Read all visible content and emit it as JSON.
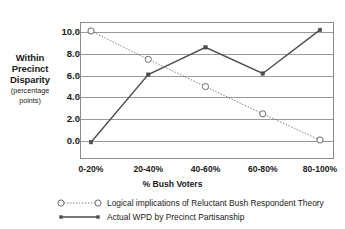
{
  "chart_data": {
    "type": "line",
    "title": "",
    "xlabel": "% Bush Voters",
    "ylabel": "Within Precinct Disparity",
    "ylabel_sub": "(percentage points)",
    "categories": [
      "0-20%",
      "20-40%",
      "40-60%",
      "60-80%",
      "80-100%"
    ],
    "ylim": [
      0.0,
      10.0
    ],
    "yticks": [
      "10.0",
      "8.0",
      "6.0",
      "4.0",
      "2.0",
      "0.0"
    ],
    "ytick_values": [
      10.0,
      8.0,
      6.0,
      4.0,
      2.0,
      0.0
    ],
    "grid": true,
    "legend_position": "bottom",
    "series": [
      {
        "name": "Logical implications of Reluctant Bush Respondent Theory",
        "marker": "open-circle",
        "line_style": "dotted",
        "color": "#6b6b6b",
        "values": [
          10.0,
          7.4,
          4.9,
          2.4,
          0.0
        ]
      },
      {
        "name": "Actual WPD by Precinct Partisanship",
        "marker": "filled-square",
        "line_style": "solid",
        "color": "#4d4d4d",
        "values": [
          -0.2,
          6.0,
          8.5,
          6.1,
          10.1
        ]
      }
    ]
  },
  "axes": {
    "y_title_main": "Within Precinct Disparity",
    "y_title_sub": "(percentage points)",
    "x_title": "% Bush Voters"
  },
  "legend": {
    "items": [
      {
        "label": "Logical implications of Reluctant Bush Respondent Theory"
      },
      {
        "label": "Actual WPD by Precinct Partisanship"
      }
    ]
  },
  "colors": {
    "frame": "#8a8a8a",
    "grid": "#9a9a9a",
    "series1": "#6b6b6b",
    "series2": "#4d4d4d",
    "text": "#1a1a1a",
    "background": "#ffffff"
  }
}
